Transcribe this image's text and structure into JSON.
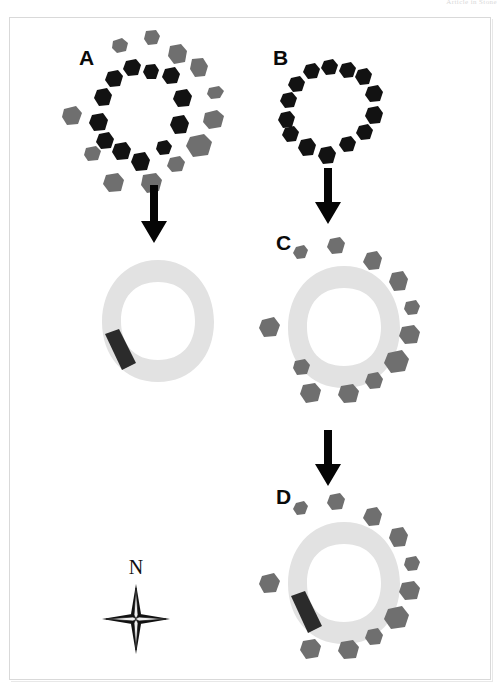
{
  "header": {
    "caption": "Article in Stone"
  },
  "figure": {
    "background_color": "#ffffff",
    "frame_color": "#d9d9d9",
    "colors": {
      "dark_stone": "#121212",
      "grey_stone": "#6f6f6f",
      "bank": "#e2e2e2",
      "causeway": "#2b2b2b",
      "arrow": "#050505"
    }
  },
  "panels": [
    {
      "id": "A",
      "label": "A",
      "description": "Inner ring of dark standing stones with an outer scatter of grey stones",
      "dark_stone_count": 16,
      "grey_stone_count": 17,
      "has_bank": false,
      "has_causeway": false
    },
    {
      "id": "B",
      "label": "B",
      "description": "Inner ring of dark standing stones only",
      "dark_stone_count": 15,
      "grey_stone_count": 0,
      "has_bank": false,
      "has_causeway": false
    },
    {
      "id": "C",
      "label": "C",
      "description": "Light grey earthwork bank ring with outer grey stone circle",
      "dark_stone_count": 0,
      "grey_stone_count": 15,
      "has_bank": true,
      "has_causeway": false
    },
    {
      "id": "D",
      "label": "D",
      "description": "Light grey earthwork bank ring with dark causeway entrance on the south-west and outer grey stone circle",
      "dark_stone_count": 0,
      "grey_stone_count": 15,
      "has_bank": true,
      "has_causeway": true
    }
  ],
  "intermediate": {
    "id": "A-result",
    "description": "Light grey earthwork bank ring with dark causeway entrance on the south-west",
    "has_bank": true,
    "has_causeway": true
  },
  "arrows": [
    {
      "id": "arrow-a-to-bank",
      "direction": "down",
      "from": "A",
      "to": "A-result"
    },
    {
      "id": "arrow-b-to-c",
      "direction": "down",
      "from": "B",
      "to": "C"
    },
    {
      "id": "arrow-c-to-d",
      "direction": "down",
      "from": "C",
      "to": "D"
    }
  ],
  "compass": {
    "label": "N",
    "type": "four-point-star",
    "orientation": "north-up"
  }
}
